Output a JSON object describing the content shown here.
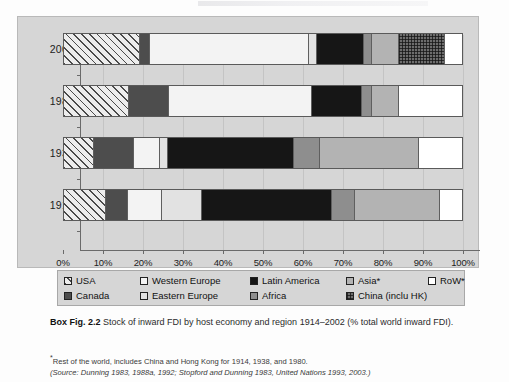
{
  "chart_data": {
    "type": "bar",
    "orientation": "horizontal",
    "stacked": true,
    "title": "Stock of inward FDI by host economy and region 1914–2002 (% total world inward FDI).",
    "xlabel": "",
    "ylabel": "",
    "xlim": [
      0,
      100
    ],
    "grid": true,
    "legend_position": "bottom",
    "categories": [
      "2002",
      "1980",
      "1938",
      "1914"
    ],
    "tick_labels": [
      "0%",
      "10%",
      "20%",
      "30%",
      "40%",
      "50%",
      "60%",
      "70%",
      "80%",
      "90%",
      "100%"
    ],
    "tick_values": [
      0,
      10,
      20,
      30,
      40,
      50,
      60,
      70,
      80,
      90,
      100
    ],
    "series": [
      {
        "name": "USA",
        "key": "usa",
        "pattern": "diagonal-hatch",
        "color": "#ededed",
        "values": [
          19.0,
          16.3,
          7.5,
          10.5
        ]
      },
      {
        "name": "Canada",
        "key": "canada",
        "pattern": "solid-dark",
        "color": "#4d4d4d",
        "values": [
          2.5,
          10.0,
          10.0,
          5.5
        ]
      },
      {
        "name": "Western Europe",
        "key": "weurope",
        "pattern": "white",
        "color": "#f3f3f3",
        "values": [
          39.8,
          35.7,
          6.5,
          8.5
        ]
      },
      {
        "name": "Eastern Europe",
        "key": "eeurope",
        "pattern": "light-fill",
        "color": "#e2e2e2",
        "values": [
          2.0,
          0.0,
          2.0,
          10.0
        ]
      },
      {
        "name": "Latin America",
        "key": "latin",
        "pattern": "solid-black",
        "color": "#161616",
        "values": [
          11.7,
          12.5,
          31.5,
          32.5
        ]
      },
      {
        "name": "Africa",
        "key": "africa",
        "pattern": "mid-gray",
        "color": "#8e8e8e",
        "values": [
          2.0,
          2.5,
          6.5,
          5.8
        ]
      },
      {
        "name": "Asia*",
        "key": "asia",
        "pattern": "light-gray",
        "color": "#b3b3b3",
        "values": [
          6.8,
          6.8,
          24.7,
          21.2
        ]
      },
      {
        "name": "China (inclu HK)",
        "key": "china",
        "pattern": "checker",
        "color": "#6d6d6d",
        "values": [
          11.5,
          0.0,
          0.0,
          0.0
        ]
      },
      {
        "name": "RoW*",
        "key": "row",
        "pattern": "white",
        "color": "#ffffff",
        "values": [
          4.7,
          16.2,
          11.3,
          6.0
        ]
      }
    ],
    "bars": [
      {
        "year": "2002",
        "segments": [
          {
            "key": "usa",
            "start": 0.0,
            "end": 19.0
          },
          {
            "key": "canada",
            "start": 19.0,
            "end": 21.5
          },
          {
            "key": "weurope",
            "start": 21.5,
            "end": 61.3
          },
          {
            "key": "eeurope",
            "start": 61.3,
            "end": 63.3
          },
          {
            "key": "latin",
            "start": 63.3,
            "end": 75.0
          },
          {
            "key": "africa",
            "start": 75.0,
            "end": 77.0
          },
          {
            "key": "asia",
            "start": 77.0,
            "end": 83.8
          },
          {
            "key": "china",
            "start": 83.8,
            "end": 95.3
          },
          {
            "key": "row",
            "start": 95.3,
            "end": 100.0
          }
        ]
      },
      {
        "year": "1980",
        "segments": [
          {
            "key": "usa",
            "start": 0.0,
            "end": 16.3
          },
          {
            "key": "canada",
            "start": 16.3,
            "end": 26.3
          },
          {
            "key": "weurope",
            "start": 26.3,
            "end": 62.0
          },
          {
            "key": "latin",
            "start": 62.0,
            "end": 74.5
          },
          {
            "key": "africa",
            "start": 74.5,
            "end": 77.0
          },
          {
            "key": "asia",
            "start": 77.0,
            "end": 83.8
          },
          {
            "key": "row",
            "start": 83.8,
            "end": 100.0
          }
        ]
      },
      {
        "year": "1938",
        "segments": [
          {
            "key": "usa",
            "start": 0.0,
            "end": 7.5
          },
          {
            "key": "canada",
            "start": 7.5,
            "end": 17.5
          },
          {
            "key": "weurope",
            "start": 17.5,
            "end": 24.0
          },
          {
            "key": "eeurope",
            "start": 24.0,
            "end": 26.0
          },
          {
            "key": "latin",
            "start": 26.0,
            "end": 57.5
          },
          {
            "key": "africa",
            "start": 57.5,
            "end": 64.0
          },
          {
            "key": "asia",
            "start": 64.0,
            "end": 88.7
          },
          {
            "key": "row",
            "start": 88.7,
            "end": 100.0
          }
        ]
      },
      {
        "year": "1914",
        "segments": [
          {
            "key": "usa",
            "start": 0.0,
            "end": 10.5
          },
          {
            "key": "canada",
            "start": 10.5,
            "end": 16.0
          },
          {
            "key": "weurope",
            "start": 16.0,
            "end": 24.5
          },
          {
            "key": "eeurope",
            "start": 24.5,
            "end": 34.5
          },
          {
            "key": "latin",
            "start": 34.5,
            "end": 67.0
          },
          {
            "key": "africa",
            "start": 67.0,
            "end": 72.8
          },
          {
            "key": "asia",
            "start": 72.8,
            "end": 94.0
          },
          {
            "key": "row",
            "start": 94.0,
            "end": 100.0
          }
        ]
      }
    ]
  },
  "legend": {
    "row1": [
      {
        "label": "USA",
        "key": "usa"
      },
      {
        "label": "Western Europe",
        "key": "weurope"
      },
      {
        "label": "Latin America",
        "key": "latin"
      },
      {
        "label": "Asia*",
        "key": "asia"
      },
      {
        "label": "RoW*",
        "key": "row"
      }
    ],
    "row2": [
      {
        "label": "Canada",
        "key": "canada"
      },
      {
        "label": "Eastern Europe",
        "key": "eeurope"
      },
      {
        "label": "Africa",
        "key": "africa"
      },
      {
        "label": "China (inclu HK)",
        "key": "china"
      }
    ]
  },
  "caption": {
    "figure_label": "Box Fig. 2.2",
    "text": "Stock of inward FDI by host economy and region 1914–2002 (% total world inward FDI)."
  },
  "footnote": {
    "star_note": "Rest of the world, includes China and Hong Kong for 1914, 1938, and 1980.",
    "source": "(Source: Dunning 1983, 1988a, 1992; Stopford and Dunning 1983, United Nations 1993, 2003.)"
  }
}
